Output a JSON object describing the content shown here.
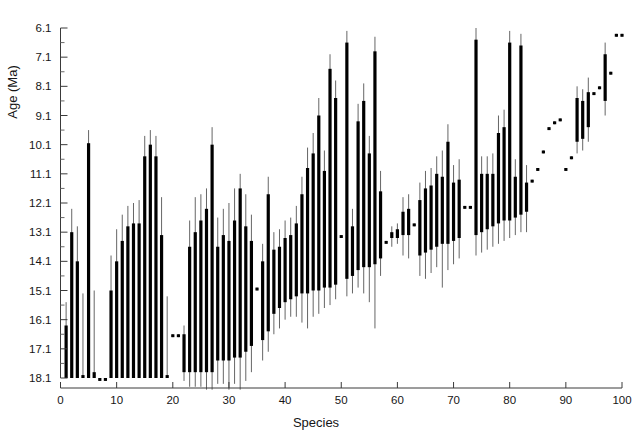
{
  "page_header": {
    "left_text": "",
    "right_text": ""
  },
  "chart_data": {
    "type": "bar",
    "title": "",
    "xlabel": "Species",
    "ylabel": "Age (Ma)",
    "xlim": [
      0,
      101
    ],
    "ylim": [
      18.6,
      5.8
    ],
    "y_axis_inverted": true,
    "xticks": [
      0,
      10,
      20,
      30,
      40,
      50,
      60,
      70,
      80,
      90,
      100
    ],
    "xtick_labels": [
      "0",
      "10",
      "20",
      "30",
      "40",
      "50",
      "60",
      "70",
      "80",
      "90",
      "100"
    ],
    "yticks": [
      6.1,
      7.1,
      8.1,
      9.1,
      10.1,
      11.1,
      12.1,
      13.1,
      14.1,
      15.1,
      16.1,
      17.1,
      18.1
    ],
    "ytick_labels": [
      "6.1",
      "7.1",
      "8.1",
      "9.1",
      "10.1",
      "11.1",
      "12.1",
      "13.1",
      "14.1",
      "15.1",
      "16.1",
      "17.1",
      "18.1"
    ],
    "y_minor_tick_step": 0.5,
    "grid": false,
    "legend": null,
    "bar_color": "#000000",
    "whisker_color": "#555555",
    "categories": [
      1,
      2,
      3,
      4,
      5,
      6,
      7,
      8,
      9,
      10,
      11,
      12,
      13,
      14,
      15,
      16,
      17,
      18,
      19,
      20,
      21,
      22,
      23,
      24,
      25,
      26,
      27,
      28,
      29,
      30,
      31,
      32,
      33,
      34,
      35,
      36,
      37,
      38,
      39,
      40,
      41,
      42,
      43,
      44,
      45,
      46,
      47,
      48,
      49,
      50,
      51,
      52,
      53,
      54,
      55,
      56,
      57,
      58,
      59,
      60,
      61,
      62,
      63,
      64,
      65,
      66,
      67,
      68,
      69,
      70,
      71,
      72,
      73,
      74,
      75,
      76,
      77,
      78,
      79,
      80,
      81,
      82,
      83,
      84,
      85,
      86,
      87,
      88,
      89,
      90,
      91,
      92,
      93,
      94,
      95,
      96,
      97,
      98,
      99,
      100
    ],
    "series": [
      {
        "name": "Species age interval",
        "bars": [
          {
            "x": 1,
            "lo": 18.1,
            "hi": 16.3,
            "wlo": 18.1,
            "whi": 15.5
          },
          {
            "x": 2,
            "lo": 18.1,
            "hi": 13.1,
            "wlo": 18.1,
            "whi": 12.3
          },
          {
            "x": 3,
            "lo": 18.1,
            "hi": 14.1,
            "wlo": 18.1,
            "whi": 12.9
          },
          {
            "x": 4,
            "lo": 18.1,
            "hi": 18.0,
            "wlo": 18.1,
            "whi": 15.2
          },
          {
            "x": 5,
            "lo": 18.1,
            "hi": 10.05,
            "wlo": 18.1,
            "whi": 9.6
          },
          {
            "x": 6,
            "lo": 18.1,
            "hi": 17.9,
            "wlo": 18.1,
            "whi": 15.1
          },
          {
            "x": 7,
            "lo": 18.2,
            "hi": 18.1,
            "wlo": 18.2,
            "whi": 18.1
          },
          {
            "x": 8,
            "lo": 18.2,
            "hi": 18.1,
            "wlo": 18.2,
            "whi": 18.1
          },
          {
            "x": 9,
            "lo": 18.1,
            "hi": 15.1,
            "wlo": 18.1,
            "whi": 13.9
          },
          {
            "x": 10,
            "lo": 18.1,
            "hi": 14.1,
            "wlo": 18.1,
            "whi": 13.0
          },
          {
            "x": 11,
            "lo": 18.1,
            "hi": 13.4,
            "wlo": 18.1,
            "whi": 12.5
          },
          {
            "x": 12,
            "lo": 18.1,
            "hi": 12.9,
            "wlo": 18.1,
            "whi": 12.2
          },
          {
            "x": 13,
            "lo": 18.1,
            "hi": 12.8,
            "wlo": 18.1,
            "whi": 12.1
          },
          {
            "x": 14,
            "lo": 18.1,
            "hi": 12.8,
            "wlo": 18.1,
            "whi": 12.0
          },
          {
            "x": 15,
            "lo": 18.1,
            "hi": 10.5,
            "wlo": 18.1,
            "whi": 9.8
          },
          {
            "x": 16,
            "lo": 18.1,
            "hi": 10.1,
            "wlo": 18.1,
            "whi": 9.6
          },
          {
            "x": 17,
            "lo": 18.1,
            "hi": 10.5,
            "wlo": 18.1,
            "whi": 9.8
          },
          {
            "x": 18,
            "lo": 18.1,
            "hi": 13.2,
            "wlo": 18.1,
            "whi": 11.9
          },
          {
            "x": 19,
            "lo": 18.1,
            "hi": 18.0,
            "wlo": 18.1,
            "whi": 15.3
          },
          {
            "x": 20,
            "lo": 16.7,
            "hi": 16.6,
            "wlo": 16.7,
            "whi": 16.6
          },
          {
            "x": 21,
            "lo": 16.7,
            "hi": 16.6,
            "wlo": 16.7,
            "whi": 16.6
          },
          {
            "x": 22,
            "lo": 17.9,
            "hi": 16.6,
            "wlo": 18.2,
            "whi": 16.3
          },
          {
            "x": 23,
            "lo": 17.9,
            "hi": 13.6,
            "wlo": 18.4,
            "whi": 12.7
          },
          {
            "x": 24,
            "lo": 17.9,
            "hi": 13.1,
            "wlo": 18.4,
            "whi": 11.9
          },
          {
            "x": 25,
            "lo": 17.9,
            "hi": 12.7,
            "wlo": 18.4,
            "whi": 11.8
          },
          {
            "x": 26,
            "lo": 17.9,
            "hi": 12.3,
            "wlo": 18.5,
            "whi": 11.6
          },
          {
            "x": 27,
            "lo": 17.9,
            "hi": 10.1,
            "wlo": 18.5,
            "whi": 9.5
          },
          {
            "x": 28,
            "lo": 17.5,
            "hi": 13.6,
            "wlo": 18.3,
            "whi": 12.6
          },
          {
            "x": 29,
            "lo": 17.5,
            "hi": 13.2,
            "wlo": 18.3,
            "whi": 12.3
          },
          {
            "x": 30,
            "lo": 17.5,
            "hi": 13.4,
            "wlo": 18.5,
            "whi": 12.1
          },
          {
            "x": 31,
            "lo": 17.4,
            "hi": 12.7,
            "wlo": 18.3,
            "whi": 11.6
          },
          {
            "x": 32,
            "lo": 17.4,
            "hi": 11.6,
            "wlo": 18.5,
            "whi": 11.1
          },
          {
            "x": 33,
            "lo": 17.2,
            "hi": 12.9,
            "wlo": 18.2,
            "whi": 11.8
          },
          {
            "x": 34,
            "lo": 17.0,
            "hi": 13.4,
            "wlo": 17.9,
            "whi": 12.5
          },
          {
            "x": 35,
            "lo": 15.1,
            "hi": 15.0,
            "wlo": 15.1,
            "whi": 15.0
          },
          {
            "x": 36,
            "lo": 16.8,
            "hi": 14.1,
            "wlo": 17.5,
            "whi": 13.5
          },
          {
            "x": 37,
            "lo": 16.5,
            "hi": 11.8,
            "wlo": 17.2,
            "whi": 11.2
          },
          {
            "x": 38,
            "lo": 15.9,
            "hi": 13.7,
            "wlo": 16.6,
            "whi": 13.1
          },
          {
            "x": 39,
            "lo": 15.7,
            "hi": 13.6,
            "wlo": 16.4,
            "whi": 13.0
          },
          {
            "x": 40,
            "lo": 15.5,
            "hi": 13.3,
            "wlo": 16.1,
            "whi": 12.7
          },
          {
            "x": 41,
            "lo": 15.4,
            "hi": 13.2,
            "wlo": 16.0,
            "whi": 12.6
          },
          {
            "x": 42,
            "lo": 15.3,
            "hi": 12.8,
            "wlo": 16.0,
            "whi": 12.2
          },
          {
            "x": 43,
            "lo": 15.2,
            "hi": 11.8,
            "wlo": 16.2,
            "whi": 11.2
          },
          {
            "x": 44,
            "lo": 15.2,
            "hi": 10.9,
            "wlo": 16.4,
            "whi": 10.2
          },
          {
            "x": 45,
            "lo": 15.1,
            "hi": 10.4,
            "wlo": 16.0,
            "whi": 9.7
          },
          {
            "x": 46,
            "lo": 15.1,
            "hi": 9.1,
            "wlo": 15.9,
            "whi": 8.5
          },
          {
            "x": 47,
            "lo": 15.0,
            "hi": 11.0,
            "wlo": 15.7,
            "whi": 10.3
          },
          {
            "x": 48,
            "lo": 15.0,
            "hi": 7.5,
            "wlo": 15.6,
            "whi": 7.0
          },
          {
            "x": 49,
            "lo": 14.9,
            "hi": 8.5,
            "wlo": 15.4,
            "whi": 7.9
          },
          {
            "x": 50,
            "lo": 13.3,
            "hi": 13.2,
            "wlo": 13.3,
            "whi": 13.2
          },
          {
            "x": 51,
            "lo": 14.7,
            "hi": 6.6,
            "wlo": 15.3,
            "whi": 6.2
          },
          {
            "x": 52,
            "lo": 14.6,
            "hi": 12.9,
            "wlo": 15.2,
            "whi": 12.3
          },
          {
            "x": 53,
            "lo": 14.4,
            "hi": 9.3,
            "wlo": 15.0,
            "whi": 8.7
          },
          {
            "x": 54,
            "lo": 14.3,
            "hi": 8.6,
            "wlo": 15.2,
            "whi": 8.0
          },
          {
            "x": 55,
            "lo": 14.3,
            "hi": 10.4,
            "wlo": 15.5,
            "whi": 9.8
          },
          {
            "x": 56,
            "lo": 14.2,
            "hi": 6.9,
            "wlo": 16.4,
            "whi": 6.4
          },
          {
            "x": 57,
            "lo": 14.0,
            "hi": 11.7,
            "wlo": 14.6,
            "whi": 11.0
          },
          {
            "x": 58,
            "lo": 13.5,
            "hi": 13.4,
            "wlo": 13.5,
            "whi": 13.4
          },
          {
            "x": 59,
            "lo": 13.3,
            "hi": 13.1,
            "wlo": 13.6,
            "whi": 12.9
          },
          {
            "x": 60,
            "lo": 13.3,
            "hi": 13.0,
            "wlo": 13.5,
            "whi": 12.8
          },
          {
            "x": 61,
            "lo": 13.2,
            "hi": 12.4,
            "wlo": 13.9,
            "whi": 11.9
          },
          {
            "x": 62,
            "lo": 13.2,
            "hi": 12.3,
            "wlo": 14.0,
            "whi": 11.8
          },
          {
            "x": 63,
            "lo": 12.9,
            "hi": 12.8,
            "wlo": 12.9,
            "whi": 12.8
          },
          {
            "x": 64,
            "lo": 13.9,
            "hi": 12.0,
            "wlo": 14.6,
            "whi": 11.4
          },
          {
            "x": 65,
            "lo": 13.8,
            "hi": 11.6,
            "wlo": 14.7,
            "whi": 11.0
          },
          {
            "x": 66,
            "lo": 13.7,
            "hi": 11.5,
            "wlo": 14.5,
            "whi": 10.9
          },
          {
            "x": 67,
            "lo": 13.6,
            "hi": 11.1,
            "wlo": 14.3,
            "whi": 10.5
          },
          {
            "x": 68,
            "lo": 13.5,
            "hi": 11.2,
            "wlo": 15.0,
            "whi": 10.3
          },
          {
            "x": 69,
            "lo": 13.5,
            "hi": 10.0,
            "wlo": 14.4,
            "whi": 9.4
          },
          {
            "x": 70,
            "lo": 13.4,
            "hi": 11.4,
            "wlo": 14.2,
            "whi": 10.8
          },
          {
            "x": 71,
            "lo": 13.3,
            "hi": 11.3,
            "wlo": 14.0,
            "whi": 10.6
          },
          {
            "x": 72,
            "lo": 12.3,
            "hi": 12.2,
            "wlo": 12.3,
            "whi": 12.2
          },
          {
            "x": 73,
            "lo": 12.3,
            "hi": 12.2,
            "wlo": 12.3,
            "whi": 12.2
          },
          {
            "x": 74,
            "lo": 13.2,
            "hi": 6.5,
            "wlo": 13.9,
            "whi": 6.1
          },
          {
            "x": 75,
            "lo": 13.1,
            "hi": 11.1,
            "wlo": 13.8,
            "whi": 10.5
          },
          {
            "x": 76,
            "lo": 13.0,
            "hi": 11.1,
            "wlo": 13.7,
            "whi": 10.5
          },
          {
            "x": 77,
            "lo": 12.9,
            "hi": 11.1,
            "wlo": 13.6,
            "whi": 10.4
          },
          {
            "x": 78,
            "lo": 12.8,
            "hi": 9.7,
            "wlo": 13.5,
            "whi": 9.1
          },
          {
            "x": 79,
            "lo": 12.7,
            "hi": 9.5,
            "wlo": 13.4,
            "whi": 8.9
          },
          {
            "x": 80,
            "lo": 12.7,
            "hi": 6.6,
            "wlo": 13.3,
            "whi": 6.2
          },
          {
            "x": 81,
            "lo": 12.6,
            "hi": 11.2,
            "wlo": 13.2,
            "whi": 10.6
          },
          {
            "x": 82,
            "lo": 12.5,
            "hi": 6.7,
            "wlo": 13.1,
            "whi": 6.3
          },
          {
            "x": 83,
            "lo": 12.4,
            "hi": 11.4,
            "wlo": 13.1,
            "whi": 10.8
          },
          {
            "x": 84,
            "lo": 11.4,
            "hi": 11.3,
            "wlo": 11.4,
            "whi": 11.3
          },
          {
            "x": 85,
            "lo": 11.0,
            "hi": 10.9,
            "wlo": 11.0,
            "whi": 10.9
          },
          {
            "x": 86,
            "lo": 10.4,
            "hi": 10.3,
            "wlo": 10.4,
            "whi": 10.3
          },
          {
            "x": 87,
            "lo": 9.6,
            "hi": 9.5,
            "wlo": 9.6,
            "whi": 9.5
          },
          {
            "x": 88,
            "lo": 9.4,
            "hi": 9.3,
            "wlo": 9.4,
            "whi": 9.3
          },
          {
            "x": 89,
            "lo": 9.3,
            "hi": 9.2,
            "wlo": 9.3,
            "whi": 9.2
          },
          {
            "x": 90,
            "lo": 11.0,
            "hi": 10.9,
            "wlo": 11.0,
            "whi": 10.9
          },
          {
            "x": 91,
            "lo": 10.6,
            "hi": 10.5,
            "wlo": 10.6,
            "whi": 10.5
          },
          {
            "x": 92,
            "lo": 10.0,
            "hi": 8.5,
            "wlo": 10.4,
            "whi": 8.1
          },
          {
            "x": 93,
            "lo": 9.9,
            "hi": 8.6,
            "wlo": 10.3,
            "whi": 8.2
          },
          {
            "x": 94,
            "lo": 9.5,
            "hi": 8.3,
            "wlo": 10.0,
            "whi": 7.8
          },
          {
            "x": 95,
            "lo": 8.4,
            "hi": 8.3,
            "wlo": 8.4,
            "whi": 8.3
          },
          {
            "x": 96,
            "lo": 8.2,
            "hi": 8.1,
            "wlo": 8.2,
            "whi": 8.1
          },
          {
            "x": 97,
            "lo": 8.6,
            "hi": 7.0,
            "wlo": 9.1,
            "whi": 6.6
          },
          {
            "x": 98,
            "lo": 7.7,
            "hi": 7.6,
            "wlo": 7.7,
            "whi": 7.6
          },
          {
            "x": 99,
            "lo": 6.4,
            "hi": 6.3,
            "wlo": 6.4,
            "whi": 6.3
          },
          {
            "x": 100,
            "lo": 6.4,
            "hi": 6.3,
            "wlo": 6.4,
            "whi": 6.3
          }
        ]
      }
    ]
  }
}
